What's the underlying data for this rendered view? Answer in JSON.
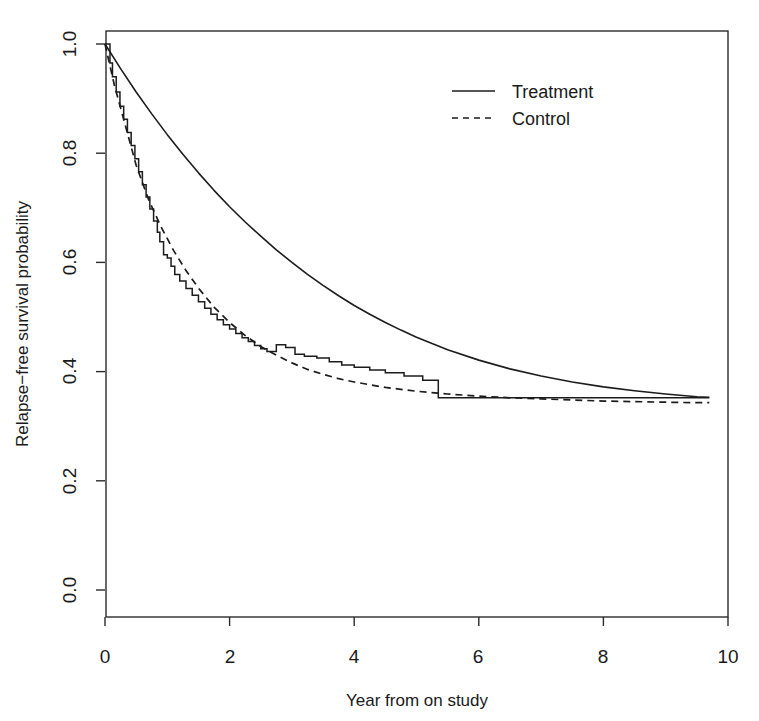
{
  "chart_data": {
    "type": "line",
    "title": "",
    "xlabel": "Year from on study",
    "ylabel": "Relapse−free survival probability",
    "xlim": [
      0,
      10
    ],
    "ylim": [
      0.0,
      1.0
    ],
    "grid": false,
    "xticks": [
      "0",
      "2",
      "4",
      "6",
      "8",
      "10"
    ],
    "xtick_values": [
      0,
      2,
      4,
      6,
      8,
      10
    ],
    "yticks": [
      "0.0",
      "0.2",
      "0.4",
      "0.6",
      "0.8",
      "1.0"
    ],
    "ytick_values": [
      0.0,
      0.2,
      0.4,
      0.6,
      0.8,
      1.0
    ],
    "legend_position": "top-right",
    "series": [
      {
        "name": "Treatment",
        "style": "solid",
        "color": "#1c1c1c",
        "x": [
          0,
          0.25,
          0.5,
          0.75,
          1.0,
          1.25,
          1.5,
          1.75,
          2.0,
          2.25,
          2.5,
          2.75,
          3.0,
          3.25,
          3.5,
          3.75,
          4.0,
          4.25,
          4.5,
          4.75,
          5.0,
          5.5,
          6.0,
          6.5,
          7.0,
          7.5,
          8.0,
          8.5,
          9.0,
          9.5,
          9.7
        ],
        "values": [
          1.0,
          0.955,
          0.912,
          0.872,
          0.834,
          0.798,
          0.764,
          0.732,
          0.702,
          0.674,
          0.648,
          0.623,
          0.6,
          0.578,
          0.558,
          0.539,
          0.521,
          0.505,
          0.49,
          0.476,
          0.463,
          0.44,
          0.421,
          0.405,
          0.392,
          0.381,
          0.372,
          0.365,
          0.359,
          0.354,
          0.353
        ]
      },
      {
        "name": "Control",
        "style": "dashed",
        "color": "#1c1c1c",
        "x": [
          0,
          0.15,
          0.3,
          0.5,
          0.7,
          0.9,
          1.1,
          1.3,
          1.5,
          1.75,
          2.0,
          2.25,
          2.5,
          2.75,
          3.0,
          3.25,
          3.5,
          3.75,
          4.0,
          4.5,
          5.0,
          5.5,
          6.0,
          6.5,
          7.0,
          7.5,
          8.0,
          8.5,
          9.0,
          9.5,
          9.7
        ],
        "values": [
          1.0,
          0.925,
          0.862,
          0.778,
          0.715,
          0.665,
          0.622,
          0.585,
          0.553,
          0.518,
          0.49,
          0.466,
          0.446,
          0.43,
          0.416,
          0.404,
          0.395,
          0.387,
          0.381,
          0.371,
          0.364,
          0.359,
          0.355,
          0.352,
          0.35,
          0.348,
          0.346,
          0.345,
          0.344,
          0.343,
          0.343
        ]
      },
      {
        "name": "Kaplan-Meier estimate",
        "style": "step",
        "color": "#1c1c1c",
        "x": [
          0,
          0.08,
          0.12,
          0.18,
          0.24,
          0.3,
          0.36,
          0.42,
          0.48,
          0.54,
          0.6,
          0.66,
          0.72,
          0.78,
          0.84,
          0.88,
          0.94,
          1.0,
          1.06,
          1.12,
          1.2,
          1.3,
          1.4,
          1.5,
          1.6,
          1.7,
          1.8,
          1.9,
          2.0,
          2.1,
          2.2,
          2.3,
          2.4,
          2.5,
          2.6,
          2.75,
          2.9,
          3.05,
          3.2,
          3.4,
          3.6,
          3.8,
          4.0,
          4.25,
          4.5,
          4.8,
          5.1,
          5.35,
          9.7
        ],
        "values": [
          1.0,
          0.965,
          0.94,
          0.912,
          0.886,
          0.862,
          0.838,
          0.814,
          0.79,
          0.766,
          0.742,
          0.72,
          0.698,
          0.676,
          0.655,
          0.638,
          0.614,
          0.608,
          0.593,
          0.578,
          0.566,
          0.552,
          0.54,
          0.528,
          0.516,
          0.505,
          0.495,
          0.486,
          0.478,
          0.47,
          0.462,
          0.455,
          0.448,
          0.442,
          0.437,
          0.449,
          0.444,
          0.432,
          0.428,
          0.425,
          0.418,
          0.412,
          0.408,
          0.403,
          0.398,
          0.392,
          0.384,
          0.352,
          0.352
        ]
      }
    ],
    "legend": [
      {
        "label": "Treatment",
        "style": "solid"
      },
      {
        "label": "Control",
        "style": "dashed"
      }
    ]
  },
  "axes": {
    "x_title": "Year from on study",
    "y_title": "Relapse−free survival probability"
  },
  "legend_items": {
    "treatment": "Treatment",
    "control": "Control"
  },
  "xtick_labels": {
    "t0": "0",
    "t1": "2",
    "t2": "4",
    "t3": "6",
    "t4": "8",
    "t5": "10"
  },
  "ytick_labels": {
    "t0": "0.0",
    "t1": "0.2",
    "t2": "0.4",
    "t3": "0.6",
    "t4": "0.8",
    "t5": "1.0"
  }
}
